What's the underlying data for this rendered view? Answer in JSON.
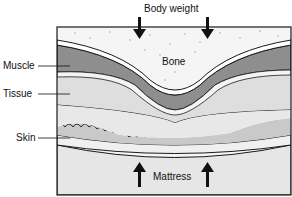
{
  "diagram": {
    "title_label": "Body weight",
    "layers": {
      "bone": "Bone",
      "muscle": "Muscle",
      "tissue": "Tissue",
      "skin": "Skin",
      "mattress": "Mattress"
    },
    "colors": {
      "bone": "#f4f4f4",
      "muscle": "#8f8f8f",
      "tissue": "#dcdcdc",
      "skin": "#ececec",
      "mattress": "#e4e4e4",
      "outline": "#1a1a1a"
    }
  }
}
